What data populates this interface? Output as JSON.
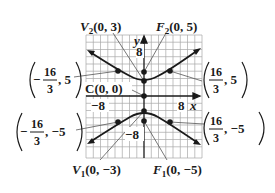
{
  "diagram": {
    "type": "hyperbola-graph",
    "equation_hint": "vertical transverse axis, center (0,0), a=3, c=5",
    "axes": {
      "x_label": "x",
      "y_label": "y",
      "tick_labels": {
        "x_neg": "−8",
        "x_pos": "8",
        "y_pos": "8",
        "y_neg": "−8"
      }
    },
    "labels": {
      "v2": {
        "name": "V",
        "sub": "2",
        "coords": "(0, 3)"
      },
      "f2": {
        "name": "F",
        "sub": "2",
        "coords": "(0, 5)"
      },
      "center": {
        "text": "C(0, 0)"
      },
      "v1": {
        "name": "V",
        "sub": "1",
        "coords": "(0, −3)"
      },
      "f1": {
        "name": "F",
        "sub": "1",
        "coords": "(0, −5)"
      },
      "upper_left": {
        "sign": "−",
        "num": "16",
        "den": "3",
        "rest": ", 5"
      },
      "upper_right": {
        "sign": "",
        "num": "16",
        "den": "3",
        "rest": ", 5"
      },
      "lower_left": {
        "sign": "−",
        "num": "16",
        "den": "3",
        "rest": ", −5"
      },
      "lower_right": {
        "sign": "",
        "num": "16",
        "den": "3",
        "rest": ", −5"
      }
    },
    "points": [
      {
        "name": "F2",
        "x": 0,
        "y": 5
      },
      {
        "name": "V2",
        "x": 0,
        "y": 3
      },
      {
        "name": "C",
        "x": 0,
        "y": 0
      },
      {
        "name": "V1",
        "x": 0,
        "y": -3
      },
      {
        "name": "F1",
        "x": 0,
        "y": -5
      },
      {
        "name": "upper-left",
        "x": -5.333,
        "y": 5
      },
      {
        "name": "upper-right",
        "x": 5.333,
        "y": 5
      },
      {
        "name": "lower-left",
        "x": -5.333,
        "y": -5
      },
      {
        "name": "lower-right",
        "x": 5.333,
        "y": -5
      }
    ],
    "colors": {
      "curve": "#1a1a1a",
      "grid": "#9a9a9a",
      "axis": "#1a1a1a",
      "leader": "#555555"
    }
  }
}
